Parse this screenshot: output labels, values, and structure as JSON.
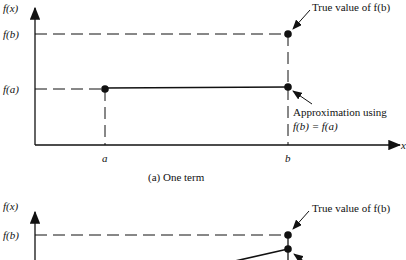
{
  "panel_a": {
    "ylabel": "f(x)",
    "tick_fb": "f(b)",
    "tick_fa": "f(a)",
    "xlabel": "x",
    "tick_a": "a",
    "tick_b": "b",
    "annotation_true": "True value of f(b)",
    "annotation_approx_line1": "Approximation using",
    "annotation_approx_line2": "f(b) = f(a)",
    "caption": "(a) One term"
  },
  "panel_b": {
    "ylabel": "f(x)",
    "tick_fb": "f(b)",
    "annotation_true": "True value of f(b)"
  }
}
